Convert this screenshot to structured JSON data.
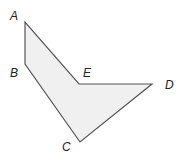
{
  "diagram": {
    "type": "polygon",
    "fill_color": "#f0f0f0",
    "stroke_color": "#555555",
    "vertices": [
      {
        "name": "A",
        "x": 25,
        "y": 22,
        "label_x": 10,
        "label_y": 20
      },
      {
        "name": "B",
        "x": 25,
        "y": 64,
        "label_x": 10,
        "label_y": 77
      },
      {
        "name": "C",
        "x": 80,
        "y": 142,
        "label_x": 62,
        "label_y": 151
      },
      {
        "name": "D",
        "x": 152,
        "y": 84,
        "label_x": 165,
        "label_y": 89
      },
      {
        "name": "E",
        "x": 79,
        "y": 84,
        "label_x": 83,
        "label_y": 77
      }
    ],
    "order": [
      "A",
      "B",
      "C",
      "D",
      "E"
    ]
  }
}
